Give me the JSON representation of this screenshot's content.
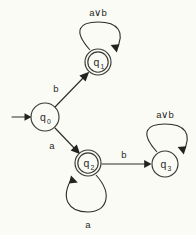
{
  "diagram": {
    "kind": "finite-state-automaton",
    "background_color": "#fbfbf6",
    "ink_color": "#2e2e28",
    "alphabet": [
      "a",
      "b"
    ],
    "or_symbol": "∨",
    "start_state": "q0",
    "states": [
      {
        "id": "q0",
        "label": "q",
        "subscript": "0",
        "accepting": false,
        "initial": true,
        "cx": 45,
        "cy": 117,
        "r": 14
      },
      {
        "id": "q1",
        "label": "q",
        "subscript": "1",
        "accepting": true,
        "initial": false,
        "cx": 98,
        "cy": 62,
        "r": 13
      },
      {
        "id": "q2",
        "label": "q",
        "subscript": "2",
        "accepting": true,
        "initial": false,
        "cx": 88,
        "cy": 163,
        "r": 13
      },
      {
        "id": "q3",
        "label": "q",
        "subscript": "3",
        "accepting": false,
        "initial": false,
        "cx": 165,
        "cy": 164,
        "r": 13
      }
    ],
    "transitions": [
      {
        "from": "q0",
        "to": "q1",
        "label": "b",
        "label_x": 56,
        "label_y": 90,
        "kind": "edge"
      },
      {
        "from": "q0",
        "to": "q2",
        "label": "a",
        "label_x": 52,
        "label_y": 147,
        "kind": "edge"
      },
      {
        "from": "q2",
        "to": "q3",
        "label": "b",
        "label_x": 124,
        "label_y": 157,
        "kind": "edge"
      },
      {
        "from": "q1",
        "to": "q1",
        "label": "a∨b",
        "label_x": 98,
        "label_y": 16,
        "kind": "self-loop"
      },
      {
        "from": "q2",
        "to": "q2",
        "label": "a",
        "label_x": 88,
        "label_y": 226,
        "kind": "self-loop"
      },
      {
        "from": "q3",
        "to": "q3",
        "label": "a∨b",
        "label_x": 165,
        "label_y": 118,
        "kind": "self-loop"
      }
    ],
    "start_arrow": {
      "x1": 12,
      "y1": 117,
      "x2": 31,
      "y2": 117
    }
  }
}
